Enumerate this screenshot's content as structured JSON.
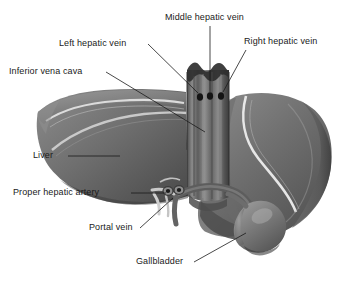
{
  "figure": {
    "background_color": "#ffffff",
    "line_color": "#1a1a1a",
    "text_color": "#1a1a1a",
    "style": "grayscale medical illustration",
    "organ_tones": {
      "liver_dark": "#4a4a4a",
      "liver_mid": "#6e6e6e",
      "liver_light": "#8f8f8f",
      "highlight": "#e8e8e8",
      "vein_dark": "#3c3c3c",
      "cava_mid": "#767676"
    }
  },
  "labels": [
    {
      "id": "middle-hepatic-vein",
      "text": "Middle hepatic vein"
    },
    {
      "id": "right-hepatic-vein",
      "text": "Right hepatic vein"
    },
    {
      "id": "left-hepatic-vein",
      "text": "Left hepatic vein"
    },
    {
      "id": "inferior-vena-cava",
      "text": "Inferior vena cava"
    },
    {
      "id": "liver",
      "text": "Liver"
    },
    {
      "id": "proper-hepatic-artery",
      "text": "Proper hepatic artery"
    },
    {
      "id": "portal-vein",
      "text": "Portal vein"
    },
    {
      "id": "gallbladder",
      "text": "Gallbladder"
    }
  ],
  "structures": [
    {
      "id": "liver-left-lobe",
      "name": "Left lobe of liver"
    },
    {
      "id": "liver-right-lobe",
      "name": "Right lobe of liver"
    },
    {
      "id": "inferior-vena-cava-trunk",
      "name": "Inferior vena cava trunk"
    },
    {
      "id": "hepatic-vein-ostia",
      "name": "Hepatic vein openings",
      "count": 3
    },
    {
      "id": "gallbladder-body",
      "name": "Gallbladder"
    },
    {
      "id": "portal-vein-vessel",
      "name": "Portal vein"
    },
    {
      "id": "proper-hepatic-artery-vessel",
      "name": "Proper hepatic artery"
    },
    {
      "id": "falciform-highlight",
      "name": "Falciform / surface highlight"
    }
  ]
}
